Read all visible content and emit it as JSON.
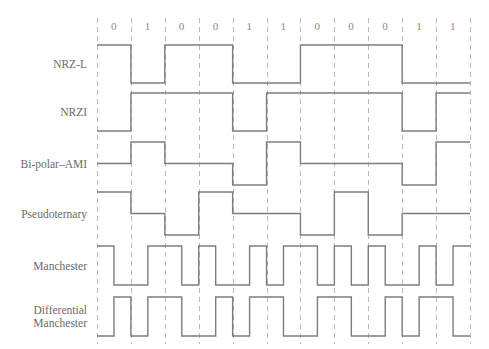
{
  "figure": {
    "bit_sequence": [
      0,
      1,
      0,
      0,
      1,
      1,
      0,
      0,
      0,
      1,
      1
    ],
    "bit_labels": [
      "0",
      "1",
      "0",
      "0",
      "1",
      "1",
      "0",
      "0",
      "0",
      "1",
      "1"
    ],
    "grid": {
      "left": 97,
      "right": 470,
      "top": 18,
      "bottom": 344,
      "cell_width": 33.9,
      "cell_count": 11,
      "line_color": "#b9b9b9",
      "wave_color": "#7d7d7d",
      "background": "#ffffff",
      "dashed": true
    },
    "rows": [
      {
        "id": "nrz-l",
        "label": "NRZ-L",
        "label_lines": [
          "NRZ-L"
        ],
        "levels": [
          1,
          -1,
          1,
          1,
          -1,
          -1,
          1,
          1,
          1,
          -1,
          -1
        ],
        "type": "two-level",
        "top": 45,
        "bottom": 83,
        "rule": "high for 0, low for 1"
      },
      {
        "id": "nrzi",
        "label": "NRZI",
        "label_lines": [
          "NRZI"
        ],
        "levels": [
          -1,
          1,
          1,
          1,
          -1,
          1,
          1,
          1,
          1,
          -1,
          1
        ],
        "type": "two-level",
        "top": 93,
        "bottom": 131,
        "rule": "transition at start of bit for 1, none for 0"
      },
      {
        "id": "bipolar-ami",
        "label": "Bi-polar–AMI",
        "label_lines": [
          "Bi-polar–AMI"
        ],
        "levels": [
          0,
          1,
          0,
          0,
          -1,
          1,
          0,
          0,
          0,
          -1,
          1
        ],
        "type": "three-level",
        "top": 142,
        "bottom": 185,
        "rule": "0 = no line signal, 1 = alternating positive and negative"
      },
      {
        "id": "pseudoternary",
        "label": "Pseudoternary",
        "label_lines": [
          "Pseudoternary"
        ],
        "levels": [
          1,
          0,
          -1,
          1,
          0,
          0,
          -1,
          1,
          -1,
          0,
          0
        ],
        "type": "three-level",
        "top": 192,
        "bottom": 235,
        "rule": "1 = no line signal, 0 = alternating positive and negative"
      },
      {
        "id": "manchester",
        "label": "Manchester",
        "label_lines": [
          "Manchester"
        ],
        "levels": [
          [
            1,
            -1
          ],
          [
            -1,
            1
          ],
          [
            1,
            -1
          ],
          [
            1,
            -1
          ],
          [
            -1,
            1
          ],
          [
            -1,
            1
          ],
          [
            1,
            -1
          ],
          [
            1,
            -1
          ],
          [
            1,
            -1
          ],
          [
            -1,
            1
          ],
          [
            -1,
            1
          ]
        ],
        "type": "biphase",
        "top": 246,
        "bottom": 285,
        "rule": "0 = high-to-low transition at middle, 1 = low-to-high transition at middle"
      },
      {
        "id": "differential-manchester",
        "label": "Differential Manchester",
        "label_lines": [
          "Differential",
          "Manchester"
        ],
        "levels": [
          [
            -1,
            1
          ],
          [
            -1,
            1
          ],
          [
            1,
            -1
          ],
          [
            -1,
            1
          ],
          [
            -1,
            1
          ],
          [
            1,
            -1
          ],
          [
            -1,
            1
          ],
          [
            1,
            -1
          ],
          [
            -1,
            1
          ],
          [
            -1,
            1
          ],
          [
            1,
            -1
          ]
        ],
        "type": "biphase",
        "top": 297,
        "bottom": 336,
        "rule": "always transition at middle; transition at start of bit for 0, none for 1"
      }
    ]
  }
}
